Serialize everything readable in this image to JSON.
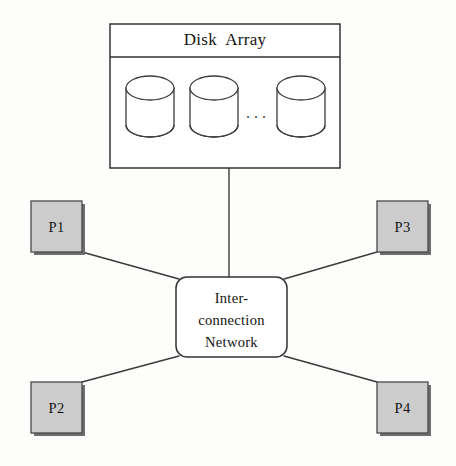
{
  "figure": {
    "kind": "shared-disk parallel architecture diagram",
    "background_color": "#fdfdfc",
    "ink_color": "#2b2b2b"
  },
  "disk_array": {
    "title": "Disk  Array",
    "fill_color": "#ffffff",
    "border_color": "#333333",
    "bounds": {
      "x": 110,
      "y": 24,
      "width": 230,
      "height": 144
    },
    "title_divider_y": 57,
    "disks": [
      {
        "name": "disk-1",
        "x": 126,
        "y": 76,
        "width": 48,
        "height": 61
      },
      {
        "name": "disk-2",
        "x": 190,
        "y": 76,
        "width": 48,
        "height": 61
      },
      {
        "name": "disk-3",
        "x": 277,
        "y": 76,
        "width": 48,
        "height": 61
      }
    ],
    "ellipsis": "..."
  },
  "network": {
    "label_lines": [
      "Inter-",
      "connection",
      "Network"
    ],
    "label_text": "Inter-\nconnection\nNetwork",
    "fill_color": "#ffffff",
    "border_color": "#333333",
    "corner_radius": 11,
    "bounds": {
      "x": 176,
      "y": 277,
      "width": 111,
      "height": 80
    }
  },
  "processors": [
    {
      "id": "p1",
      "label": "P1",
      "fill_color": "#cccccc",
      "border_color": "#4a4a4a",
      "shadow_color": "#6e6e6e",
      "bounds": {
        "x": 31,
        "y": 201,
        "width": 51,
        "height": 51
      }
    },
    {
      "id": "p2",
      "label": "P2",
      "fill_color": "#cccccc",
      "border_color": "#4a4a4a",
      "shadow_color": "#6e6e6e",
      "bounds": {
        "x": 31,
        "y": 382,
        "width": 51,
        "height": 51
      }
    },
    {
      "id": "p3",
      "label": "P3",
      "fill_color": "#cccccc",
      "border_color": "#4a4a4a",
      "shadow_color": "#6e6e6e",
      "bounds": {
        "x": 377,
        "y": 201,
        "width": 51,
        "height": 51
      }
    },
    {
      "id": "p4",
      "label": "P4",
      "fill_color": "#cccccc",
      "border_color": "#4a4a4a",
      "shadow_color": "#6e6e6e",
      "bounds": {
        "x": 377,
        "y": 382,
        "width": 51,
        "height": 51
      }
    }
  ],
  "links": [
    {
      "name": "link-disk-array-to-network",
      "from": "disk_array",
      "to": "network",
      "x1": 229,
      "y1": 168,
      "x2": 229,
      "y2": 277
    },
    {
      "name": "link-p1-to-network",
      "from": "p1",
      "to": "network",
      "x1": 82,
      "y1": 252,
      "x2": 179,
      "y2": 279
    },
    {
      "name": "link-p2-to-network",
      "from": "p2",
      "to": "network",
      "x1": 82,
      "y1": 382,
      "x2": 179,
      "y2": 356
    },
    {
      "name": "link-p3-to-network",
      "from": "p3",
      "to": "network",
      "x1": 377,
      "y1": 252,
      "x2": 284,
      "y2": 279
    },
    {
      "name": "link-p4-to-network",
      "from": "p4",
      "to": "network",
      "x1": 377,
      "y1": 382,
      "x2": 284,
      "y2": 356
    }
  ]
}
